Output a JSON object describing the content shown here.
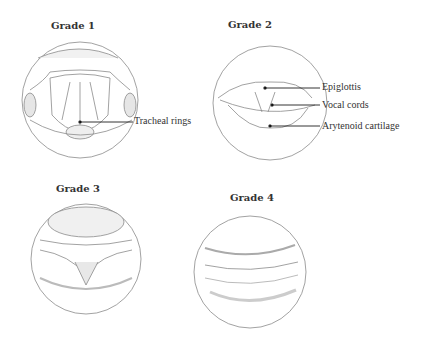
{
  "panels": [
    {
      "title": "Grade 1",
      "labels": [
        "Tracheal rings"
      ]
    },
    {
      "title": "Grade 2",
      "labels": [
        "Epiglottis",
        "Vocal cords",
        "Arytenoid cartilage"
      ]
    },
    {
      "title": "Grade 3",
      "labels": []
    },
    {
      "title": "Grade 4",
      "labels": []
    }
  ]
}
